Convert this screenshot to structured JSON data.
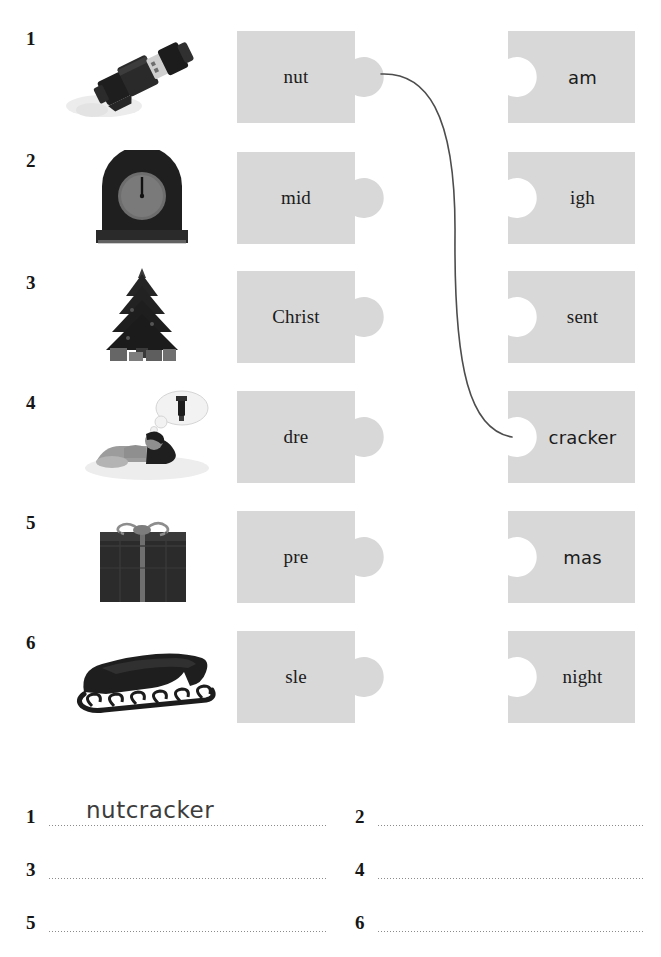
{
  "worksheet": {
    "piece_fill": "#d8d8d8",
    "connector_color": "#4d4d4d",
    "rows": [
      {
        "number": "1",
        "picture": "nutcracker-soldier-image",
        "left_piece": "nut",
        "right_piece": "am",
        "connected": true
      },
      {
        "number": "2",
        "picture": "clock-midnight-image",
        "left_piece": "mid",
        "right_piece": "igh",
        "connected": false
      },
      {
        "number": "3",
        "picture": "christmas-tree-image",
        "left_piece": "Christ",
        "right_piece": "sent",
        "connected": false
      },
      {
        "number": "4",
        "picture": "girl-dreaming-image",
        "left_piece": "dre",
        "right_piece": "cracker",
        "connected": true
      },
      {
        "number": "5",
        "picture": "wrapped-present-image",
        "left_piece": "pre",
        "right_piece": "mas",
        "connected": false
      },
      {
        "number": "6",
        "picture": "sleigh-image",
        "left_piece": "sle",
        "right_piece": "night",
        "connected": false
      }
    ]
  },
  "answers": [
    {
      "number": "1",
      "value": "nutcracker"
    },
    {
      "number": "2",
      "value": ""
    },
    {
      "number": "3",
      "value": ""
    },
    {
      "number": "4",
      "value": ""
    },
    {
      "number": "5",
      "value": ""
    },
    {
      "number": "6",
      "value": ""
    }
  ]
}
